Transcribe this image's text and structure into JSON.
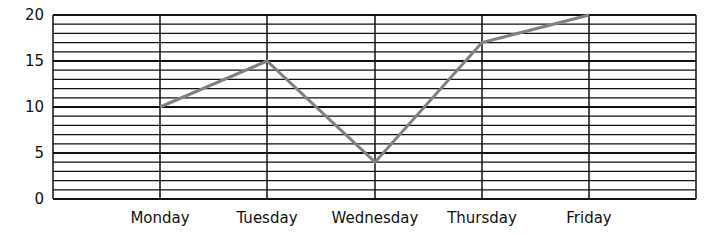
{
  "chart_data": {
    "type": "line",
    "title": "",
    "xlabel": "",
    "ylabel": "",
    "categories": [
      "Monday",
      "Tuesday",
      "Wednesday",
      "Thursday",
      "Friday"
    ],
    "values": [
      10,
      15,
      4,
      17,
      20
    ],
    "ylim": [
      0,
      20
    ],
    "yticks": [
      0,
      5,
      10,
      15,
      20
    ],
    "grid": true,
    "line_color": "#808080",
    "legend": null
  }
}
